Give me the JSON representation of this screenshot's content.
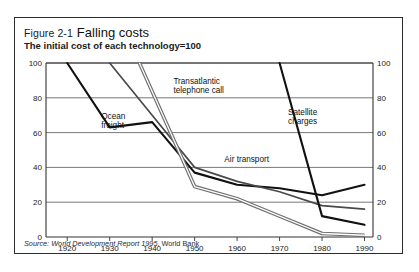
{
  "figure": {
    "number": "Figure 2-1",
    "title": "Falling costs",
    "subtitle": "The initial cost of each technology=100",
    "source_label": "Source:",
    "source_title": "World Development Report 1995",
    "source_publisher": ", World Bank"
  },
  "colors": {
    "frame": "#2c2c2c",
    "axis": "#333333",
    "grid": "#555555",
    "ocean_freight": "#111111",
    "satellite": "#111111",
    "air_transport": "#4a4a4a",
    "transatlantic": "#9a9a9a",
    "background": "#ffffff"
  },
  "chart_data": {
    "type": "line",
    "title": "Falling costs",
    "subtitle": "The initial cost of each technology=100",
    "xlabel": "",
    "ylabel": "",
    "xlim": [
      1915,
      1992
    ],
    "ylim": [
      0,
      100
    ],
    "yticks": [
      0,
      20,
      40,
      60,
      80,
      100
    ],
    "xticks": [
      1920,
      1930,
      1940,
      1950,
      1960,
      1970,
      1980,
      1990
    ],
    "grid": "horizontal",
    "y_axis_both_sides": true,
    "legend": "inline-annotations",
    "series": [
      {
        "name": "Ocean freight",
        "label_x": 1928,
        "label_y": 68,
        "color": "#111111",
        "width": 2.1,
        "x": [
          1920,
          1930,
          1940,
          1950,
          1960,
          1970,
          1980,
          1990
        ],
        "y": [
          100,
          63,
          66,
          37,
          30,
          28,
          24,
          30
        ]
      },
      {
        "name": "Air transport",
        "label_x": 1957,
        "label_y": 43,
        "color": "#4a4a4a",
        "width": 1.7,
        "x": [
          1930,
          1940,
          1950,
          1960,
          1970,
          1980,
          1990
        ],
        "y": [
          100,
          70,
          40,
          32,
          26,
          18,
          16
        ]
      },
      {
        "name": "Transatlantic telephone call",
        "label_x": 1945,
        "label_y": 88,
        "color": "#9a9a9a",
        "width": 2.4,
        "x": [
          1937,
          1950,
          1960,
          1970,
          1980,
          1990
        ],
        "y": [
          100,
          29,
          22,
          12,
          2,
          1
        ]
      },
      {
        "name": "Satellite charges",
        "label_x": 1972,
        "label_y": 70,
        "color": "#111111",
        "width": 2.1,
        "x": [
          1970,
          1980,
          1990
        ],
        "y": [
          100,
          12,
          7
        ]
      }
    ]
  }
}
